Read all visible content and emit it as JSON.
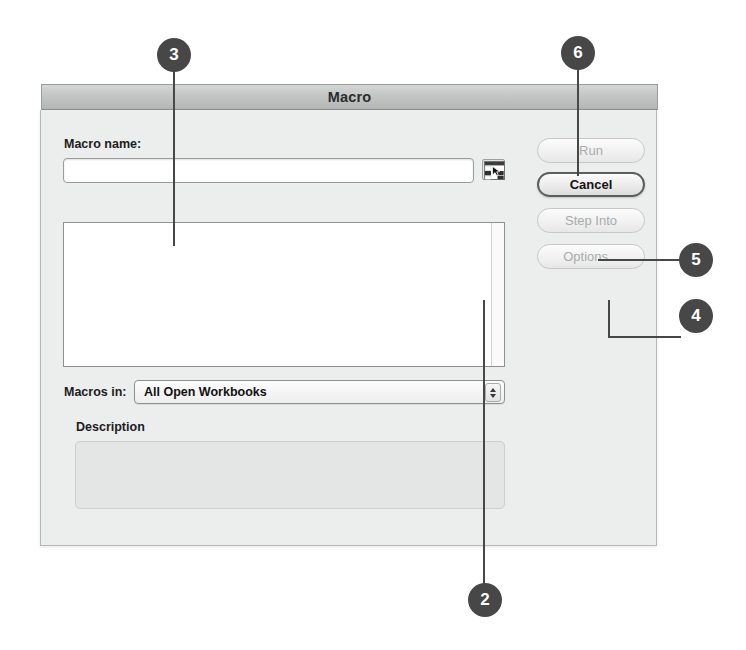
{
  "dialog": {
    "title": "Macro",
    "macro_name_label": "Macro name:",
    "macro_name_value": "",
    "macro_name_placeholder": "",
    "grid_picker_icon": "spreadsheet-range-icon",
    "macros_in_label": "Macros in:",
    "macros_in_selected": "All Open Workbooks",
    "macros_in_options": [
      "All Open Workbooks"
    ],
    "description_label": "Description",
    "description_value": "",
    "list_items": [],
    "buttons": [
      {
        "label": "Run",
        "name": "run-button",
        "enabled": false
      },
      {
        "label": "Cancel",
        "name": "cancel-button",
        "enabled": true
      },
      {
        "label": "Step Into",
        "name": "step-into-button",
        "enabled": false
      },
      {
        "label": "Options...",
        "name": "options-button",
        "enabled": false
      }
    ]
  },
  "callouts": [
    {
      "number": "3",
      "target": "macro-list-box"
    },
    {
      "number": "6",
      "target": "run-button"
    },
    {
      "number": "5",
      "target": "step-into-button"
    },
    {
      "number": "4",
      "target": "options-button"
    },
    {
      "number": "2",
      "target": "macros-in-dropdown"
    }
  ],
  "colors": {
    "badge_fill": "#474747",
    "badge_text": "#ffffff",
    "dialog_bg": "#eceeee",
    "titlebar_top": "#d4d6d6",
    "titlebar_bottom": "#b4b6b6",
    "field_bg": "#ffffff",
    "disabled_text": "#a9abab",
    "enabled_text": "#131313",
    "description_bg": "#e4e6e6"
  }
}
